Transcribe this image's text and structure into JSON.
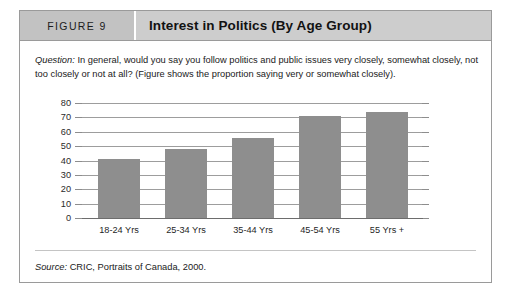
{
  "figure": {
    "number_label": "FIGURE 9",
    "title": "Interest in Politics (By Age Group)",
    "question_label": "Question:",
    "question_text": " In general, would you say you follow politics and public issues very closely, somewhat closely, not too closely or not at all? (Figure shows the proportion saying very or somewhat closely).",
    "source_label": "Source:",
    "source_text": " CRIC, Portraits of Canada, 2000."
  },
  "colors": {
    "bar_fill": "#8e8e8e",
    "header_number_bg": "#c2c2c2",
    "header_title_bg": "#cdcdcd",
    "frame_border": "#9a9a9a",
    "gridline": "#9d9d9d"
  },
  "chart_data": {
    "type": "bar",
    "title": "Interest in Politics (By Age Group)",
    "xlabel": "",
    "ylabel": "",
    "categories": [
      "18-24 Yrs",
      "25-34 Yrs",
      "35-44 Yrs",
      "45-54 Yrs",
      "55 Yrs +"
    ],
    "values": [
      41,
      48,
      56,
      71,
      74
    ],
    "ylim": [
      0,
      80
    ],
    "yticks": [
      0,
      10,
      20,
      30,
      40,
      50,
      60,
      70,
      80
    ],
    "ytick_labels": [
      "0",
      "10",
      "20",
      "30",
      "40",
      "50",
      "60",
      "70",
      "80"
    ],
    "grid": true,
    "legend": false,
    "series": [
      {
        "name": "Proportion very or somewhat closely (%)",
        "values": [
          41,
          48,
          56,
          71,
          74
        ]
      }
    ]
  }
}
